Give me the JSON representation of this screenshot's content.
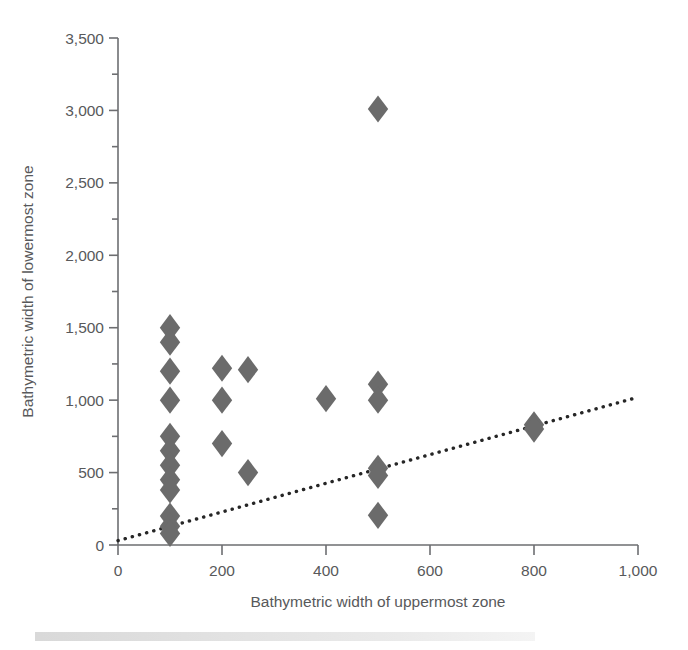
{
  "chart_data": {
    "type": "scatter",
    "title": "",
    "xlabel": "Bathymetric width of uppermost zone",
    "ylabel": "Bathymetric width of lowermost zone",
    "xlim": [
      0,
      1000
    ],
    "ylim": [
      0,
      3500
    ],
    "xticks": [
      0,
      200,
      400,
      600,
      800,
      1000
    ],
    "xtick_labels": [
      "0",
      "200",
      "400",
      "600",
      "800",
      "1,000"
    ],
    "yticks": [
      0,
      500,
      1000,
      1500,
      2000,
      2500,
      3000,
      3500
    ],
    "ytick_labels": [
      "0",
      "500",
      "1,000",
      "1,500",
      "2,000",
      "2,500",
      "3,000",
      "3,500"
    ],
    "xtick_minor_step": 100,
    "ytick_minor_step": 250,
    "grid": false,
    "legend": null,
    "marker_symbol": "diamond",
    "marker_color": "#6b6b6b",
    "points": [
      {
        "x": 100,
        "y": 1500
      },
      {
        "x": 100,
        "y": 1400
      },
      {
        "x": 100,
        "y": 1200
      },
      {
        "x": 100,
        "y": 1000
      },
      {
        "x": 100,
        "y": 750
      },
      {
        "x": 100,
        "y": 650
      },
      {
        "x": 100,
        "y": 550
      },
      {
        "x": 100,
        "y": 450
      },
      {
        "x": 100,
        "y": 380
      },
      {
        "x": 100,
        "y": 200
      },
      {
        "x": 100,
        "y": 130
      },
      {
        "x": 100,
        "y": 80
      },
      {
        "x": 200,
        "y": 1220
      },
      {
        "x": 200,
        "y": 1000
      },
      {
        "x": 200,
        "y": 700
      },
      {
        "x": 250,
        "y": 1210
      },
      {
        "x": 250,
        "y": 500
      },
      {
        "x": 400,
        "y": 1010
      },
      {
        "x": 500,
        "y": 3010
      },
      {
        "x": 500,
        "y": 1110
      },
      {
        "x": 500,
        "y": 1000
      },
      {
        "x": 500,
        "y": 530
      },
      {
        "x": 500,
        "y": 480
      },
      {
        "x": 500,
        "y": 205
      },
      {
        "x": 800,
        "y": 830
      },
      {
        "x": 800,
        "y": 800
      }
    ],
    "trendline": {
      "style": "dotted",
      "color": "#262626",
      "x_start": 0,
      "y_start": 30,
      "x_end": 1000,
      "y_end": 1020
    }
  },
  "figure": {
    "background_color": "#ffffff",
    "axis_color": "#6d6e71",
    "text_color": "#58595b"
  }
}
